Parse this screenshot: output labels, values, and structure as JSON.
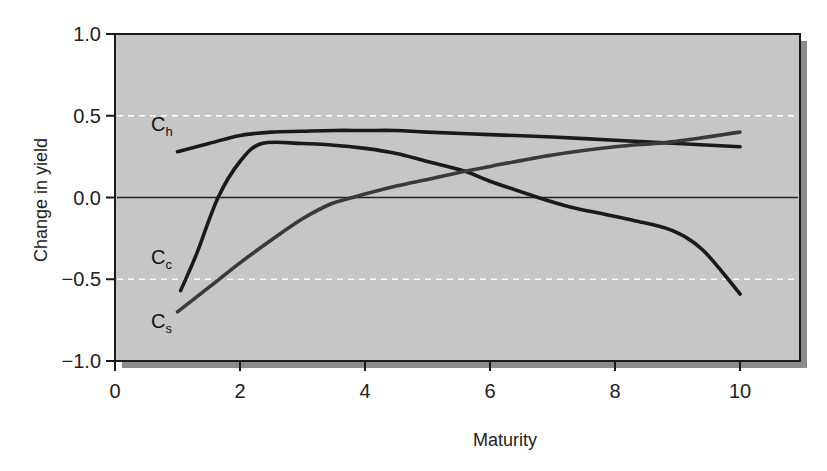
{
  "chart_data": {
    "type": "line",
    "title": "",
    "xlabel": "Maturity",
    "ylabel": "Change in yield",
    "xlim": [
      0,
      11
    ],
    "ylim": [
      -1.0,
      1.0
    ],
    "x_ticks": [
      0,
      2,
      4,
      6,
      8,
      10
    ],
    "x_tick_labels": [
      "0",
      "2",
      "4",
      "6",
      "8",
      "10"
    ],
    "y_ticks": [
      1.0,
      0.5,
      0.0,
      -0.5,
      -1.0
    ],
    "y_tick_labels": [
      "1.0",
      "0.5",
      "0.0",
      "−0.5",
      "−1.0"
    ],
    "grid": false,
    "reference_lines": [
      {
        "y": 0.5,
        "style": "dashed",
        "color": "#ffffff"
      },
      {
        "y": 0.0,
        "style": "solid",
        "color": "#222222"
      },
      {
        "y": -0.5,
        "style": "dashed",
        "color": "#ffffff"
      }
    ],
    "legend": "inline labels near curve starts",
    "series": [
      {
        "name": "Ch",
        "label_main": "C",
        "label_sub": "h",
        "color": "#1a1a1a",
        "x": [
          1.0,
          1.5,
          2.0,
          2.5,
          3.0,
          3.5,
          4.0,
          4.5,
          5.0,
          6.0,
          7.0,
          8.0,
          9.0,
          10.0
        ],
        "y": [
          0.28,
          0.33,
          0.38,
          0.4,
          0.405,
          0.41,
          0.41,
          0.41,
          0.4,
          0.385,
          0.37,
          0.35,
          0.33,
          0.31
        ]
      },
      {
        "name": "Cc",
        "label_main": "C",
        "label_sub": "c",
        "color": "#1a1a1a",
        "x": [
          1.05,
          1.3,
          1.65,
          2.0,
          2.35,
          3.0,
          3.5,
          4.0,
          4.5,
          5.0,
          5.6,
          6.0,
          6.77,
          7.3,
          7.8,
          8.3,
          8.9,
          9.4,
          10.0
        ],
        "y": [
          -0.57,
          -0.35,
          0.0,
          0.22,
          0.33,
          0.33,
          0.32,
          0.3,
          0.27,
          0.22,
          0.16,
          0.1,
          0.0,
          -0.06,
          -0.1,
          -0.14,
          -0.2,
          -0.32,
          -0.59
        ]
      },
      {
        "name": "Cs",
        "label_main": "C",
        "label_sub": "s",
        "color": "#3a3a3a",
        "x": [
          1.0,
          1.5,
          2.0,
          2.5,
          3.0,
          3.45,
          3.8,
          4.5,
          5.0,
          5.6,
          6.0,
          7.0,
          8.0,
          8.9,
          10.0
        ],
        "y": [
          -0.7,
          -0.55,
          -0.4,
          -0.26,
          -0.13,
          -0.04,
          0.0,
          0.07,
          0.11,
          0.16,
          0.19,
          0.26,
          0.31,
          0.34,
          0.4
        ]
      }
    ]
  },
  "colors": {
    "plot_background": "#c6c6c6",
    "plot_shadow": "#8c8c8c",
    "frame": "#1a1a1a"
  }
}
